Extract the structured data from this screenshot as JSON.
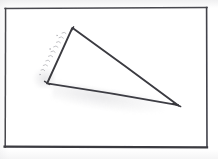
{
  "document": {
    "kind": "scanned-hand-drawn-geometry-figure",
    "medium": "pencil on white paper",
    "background_color": "#ffffff",
    "ink_color": "#3a3a3f",
    "frame_color": "#3c3c41",
    "annotation_color": "#5c5c64"
  },
  "frame": {
    "name": "figure-border",
    "left": 5,
    "top": 8,
    "right": 207,
    "bottom": 147,
    "stroke_width": 1.4,
    "bottom_stroke_width": 2.2
  },
  "figure": {
    "shape": "triangle",
    "label": "",
    "stroke_width": 1.8,
    "vertices": [
      {
        "name": "apex",
        "x": 72,
        "y": 28
      },
      {
        "name": "left",
        "x": 47,
        "y": 83
      },
      {
        "name": "right",
        "x": 178,
        "y": 105
      }
    ],
    "edges": [
      {
        "name": "left-edge",
        "from": "apex",
        "to": "left"
      },
      {
        "name": "base-edge",
        "from": "left",
        "to": "right"
      },
      {
        "name": "hypotenuse-edge",
        "from": "apex",
        "to": "right"
      }
    ]
  },
  "annotation": {
    "name": "handwritten-note",
    "text": "",
    "legible": false,
    "position": "parallel to left edge, outside triangle",
    "angle_deg": 65
  },
  "artifacts": [
    {
      "name": "graphite-smudge-under-base",
      "opacity": 0.2
    },
    {
      "name": "graphite-smudge-left-vertex",
      "opacity": 0.22
    }
  ]
}
